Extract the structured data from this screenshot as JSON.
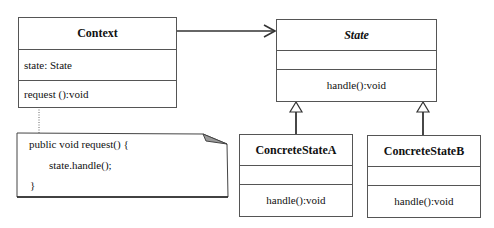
{
  "diagram": {
    "type": "UML class diagram",
    "pattern": "State",
    "classes": [
      {
        "id": "context",
        "name": "Context",
        "abstract": false,
        "attributes": [
          "state: State"
        ],
        "operations": [
          "request ():void"
        ]
      },
      {
        "id": "state",
        "name": "State",
        "abstract": true,
        "attributes": [],
        "operations": [
          "handle():void"
        ]
      },
      {
        "id": "concrete_a",
        "name": "ConcreteStateA",
        "abstract": false,
        "attributes": [],
        "operations": [
          "handle():void"
        ]
      },
      {
        "id": "concrete_b",
        "name": "ConcreteStateB",
        "abstract": false,
        "attributes": [],
        "operations": [
          "handle():void"
        ]
      }
    ],
    "note": {
      "attached_to": "context",
      "lines": [
        "public void request() {",
        "state.handle();",
        "}"
      ]
    },
    "relationships": [
      {
        "type": "association",
        "from": "context",
        "to": "state",
        "arrow": "open"
      },
      {
        "type": "generalization",
        "from": "concrete_a",
        "to": "state"
      },
      {
        "type": "generalization",
        "from": "concrete_b",
        "to": "state"
      },
      {
        "type": "note-link",
        "from": "note",
        "to": "context",
        "style": "dotted"
      }
    ],
    "colors": {
      "line": "#333333",
      "border": "#555555",
      "fold_fill": "#9a9a9a",
      "background": "#ffffff"
    }
  }
}
